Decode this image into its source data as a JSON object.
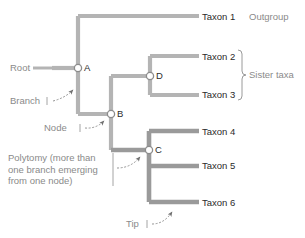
{
  "figure": {
    "colors": {
      "branch_light": "#b4b4b4",
      "branch_dark": "#9a9a9a",
      "node_fill": "#ffffff",
      "node_stroke": "#8c8c8c",
      "text_dark": "#2b2b2b",
      "text_gray": "#8a8a8a",
      "arrow": "#6f6f6f",
      "bracket": "#9a9a9a",
      "background": "#ffffff"
    }
  },
  "taxa": [
    {
      "id": "taxon-1",
      "label": "Taxon 1",
      "y": 17
    },
    {
      "id": "taxon-2",
      "label": "Taxon 2",
      "y": 57
    },
    {
      "id": "taxon-3",
      "label": "Taxon 3",
      "y": 95
    },
    {
      "id": "taxon-4",
      "label": "Taxon 4",
      "y": 132
    },
    {
      "id": "taxon-5",
      "label": "Taxon 5",
      "y": 166
    },
    {
      "id": "taxon-6",
      "label": "Taxon 6",
      "y": 203
    }
  ],
  "nodes": [
    {
      "id": "node-a",
      "letter": "A",
      "x": 78,
      "y": 68
    },
    {
      "id": "node-b",
      "letter": "B",
      "x": 111,
      "y": 114
    },
    {
      "id": "node-c",
      "letter": "C",
      "x": 149,
      "y": 150
    },
    {
      "id": "node-d",
      "letter": "D",
      "x": 150,
      "y": 76
    }
  ],
  "annotations": {
    "root": "Root",
    "branch": "Branch",
    "node": "Node",
    "tip": "Tip",
    "outgroup": "Outgroup",
    "sister_taxa": "Sister taxa",
    "polytomy_line1": "Polytomy (more than",
    "polytomy_line2": "one branch emerging",
    "polytomy_line3": "from one node)"
  }
}
